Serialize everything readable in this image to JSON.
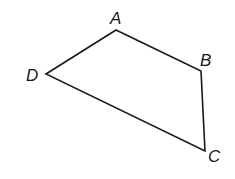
{
  "diagram": {
    "type": "quadrilateral",
    "stroke_color": "#1a1a1a",
    "vertices": [
      {
        "label": "A",
        "x": 116,
        "y": 30,
        "label_x": 110,
        "label_y": 24
      },
      {
        "label": "B",
        "x": 201,
        "y": 71,
        "label_x": 200,
        "label_y": 66
      },
      {
        "label": "C",
        "x": 205,
        "y": 151,
        "label_x": 208,
        "label_y": 162
      },
      {
        "label": "D",
        "x": 46,
        "y": 74,
        "label_x": 26,
        "label_y": 81
      }
    ],
    "edges": [
      "AB",
      "BC",
      "CD",
      "DA"
    ]
  }
}
